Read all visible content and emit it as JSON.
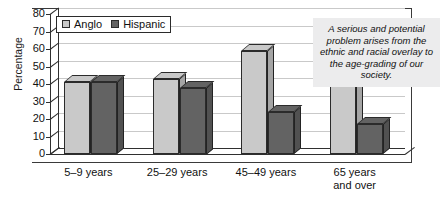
{
  "chart_data": {
    "type": "bar",
    "title": "",
    "subtitle": "",
    "xlabel": "",
    "ylabel": "Percentage",
    "ylim": [
      0,
      80
    ],
    "ytick_step": 10,
    "yticks": [
      "80",
      "70",
      "60",
      "50",
      "40",
      "30",
      "20",
      "10",
      "0"
    ],
    "grid": true,
    "legend_position": "top-left",
    "categories": [
      "5–9 years",
      "25–29 years",
      "45–49 years",
      "65 years and over"
    ],
    "category_lines": [
      [
        "5–9 years"
      ],
      [
        "25–29 years"
      ],
      [
        "45–49 years"
      ],
      [
        "65 years",
        "and over"
      ]
    ],
    "series": [
      {
        "name": "Anglo",
        "color": "#c9c9c9",
        "values": [
          41,
          43,
          59,
          73
        ]
      },
      {
        "name": "Hispanic",
        "color": "#636363",
        "values": [
          41,
          38,
          24,
          17
        ]
      }
    ]
  },
  "legend": {
    "entries": [
      {
        "label": "Anglo",
        "color": "#c9c9c9"
      },
      {
        "label": "Hispanic",
        "color": "#636363"
      }
    ]
  },
  "callout": {
    "text": "A serious and potential problem arises from the ethnic and racial overlay to the age-grading of our society.",
    "background": "#ececed"
  },
  "colors": {
    "anglo": "#c9c9c9",
    "hispanic": "#636363",
    "axis": "#2f2f2f",
    "grid": "#c9c9c9",
    "outline": "#2b2b2b",
    "text": "#111111",
    "background": "#ffffff"
  }
}
